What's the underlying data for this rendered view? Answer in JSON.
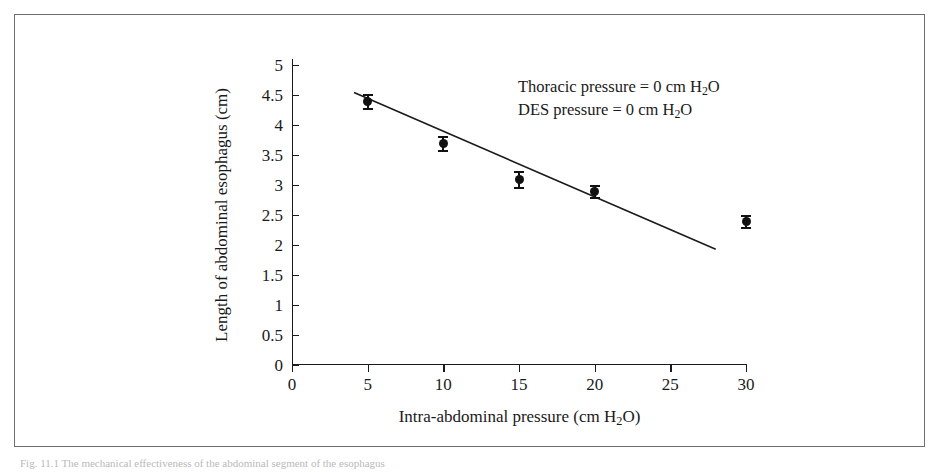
{
  "figure": {
    "caption": "Fig. 11.1 The mechanical effectiveness of the abdominal segment of the esophagus"
  },
  "chart_data": {
    "type": "scatter",
    "title": "",
    "xlabel": "Intra-abdominal pressure (cm H2O)",
    "ylabel": "Length of abdominal esophagus (cm)",
    "xlabel_parts": {
      "before": "Intra-abdominal pressure (cm H",
      "sub": "2",
      "after": "O)"
    },
    "ylabel_text": "Length of abdominal esophagus (cm)",
    "xlim": [
      0,
      30
    ],
    "ylim": [
      0,
      5
    ],
    "xticks": [
      0,
      5,
      10,
      15,
      20,
      25,
      30
    ],
    "xtick_labels": [
      "0",
      "5",
      "10",
      "15",
      "20",
      "25",
      "30"
    ],
    "yticks": [
      0,
      0.5,
      1,
      1.5,
      2,
      2.5,
      3,
      3.5,
      4,
      4.5,
      5
    ],
    "ytick_labels": [
      "0",
      "0.5",
      "1",
      "1.5",
      "2",
      "2.5",
      "3",
      "3.5",
      "4",
      "4.5",
      "5"
    ],
    "grid": false,
    "legend": "none",
    "x": [
      5,
      10,
      15,
      20,
      30
    ],
    "y": [
      4.4,
      3.7,
      3.1,
      2.9,
      2.4
    ],
    "yerr": [
      0.12,
      0.12,
      0.13,
      0.1,
      0.1
    ],
    "marker": "filled-circle",
    "errorbars": true,
    "fit_line": {
      "type": "linear",
      "x_start": 4.1,
      "y_start": 4.54,
      "x_end": 28.0,
      "y_end": 1.93
    },
    "annotations": [
      {
        "id": "thoracic-pressure",
        "before": "Thoracic pressure = 0  cm H",
        "sub": "2",
        "after": "O"
      },
      {
        "id": "des-pressure",
        "before": "DES pressure = 0 cm H",
        "sub": "2",
        "after": "O"
      }
    ]
  }
}
